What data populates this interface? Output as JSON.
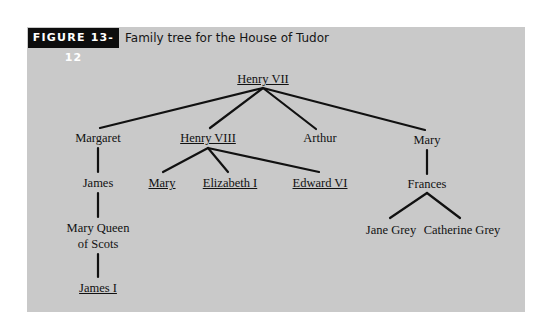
{
  "figure": {
    "label": "FIGURE 13-12",
    "caption": "Family tree for the House of Tudor"
  },
  "colors": {
    "panel_background": "#c9c9c9",
    "label_background": "#0d0d0d",
    "line_color": "#111111"
  },
  "legend_note": "Underlined names are monarchs",
  "tree": {
    "henry_vii": {
      "name": "Henry VII",
      "underlined": true
    },
    "margaret": {
      "name": "Margaret",
      "underlined": false
    },
    "henry_viii": {
      "name": "Henry VIII",
      "underlined": true
    },
    "arthur": {
      "name": "Arthur",
      "underlined": false
    },
    "mary_tudor_sister": {
      "name": "Mary",
      "underlined": false
    },
    "james": {
      "name": "James",
      "underlined": false
    },
    "mary_i": {
      "name": "Mary",
      "underlined": true
    },
    "elizabeth_i": {
      "name": "Elizabeth I",
      "underlined": true
    },
    "edward_vi": {
      "name": "Edward VI",
      "underlined": true
    },
    "frances": {
      "name": "Frances",
      "underlined": false
    },
    "mary_queen_of_scots_line1": {
      "name": "Mary Queen",
      "underlined": false
    },
    "mary_queen_of_scots_line2": {
      "name": "of Scots",
      "underlined": false
    },
    "james_i": {
      "name": "James I",
      "underlined": true
    },
    "jane_grey": {
      "name": "Jane Grey",
      "underlined": false
    },
    "catherine_grey": {
      "name": "Catherine Grey",
      "underlined": false
    }
  },
  "edges": [
    [
      "Henry VII",
      "Margaret"
    ],
    [
      "Henry VII",
      "Henry VIII"
    ],
    [
      "Henry VII",
      "Arthur"
    ],
    [
      "Henry VII",
      "Mary"
    ],
    [
      "Margaret",
      "James"
    ],
    [
      "James",
      "Mary Queen of Scots"
    ],
    [
      "Mary Queen of Scots",
      "James I"
    ],
    [
      "Henry VIII",
      "Mary"
    ],
    [
      "Henry VIII",
      "Elizabeth I"
    ],
    [
      "Henry VIII",
      "Edward VI"
    ],
    [
      "Mary",
      "Frances"
    ],
    [
      "Frances",
      "Jane Grey"
    ],
    [
      "Frances",
      "Catherine Grey"
    ]
  ]
}
